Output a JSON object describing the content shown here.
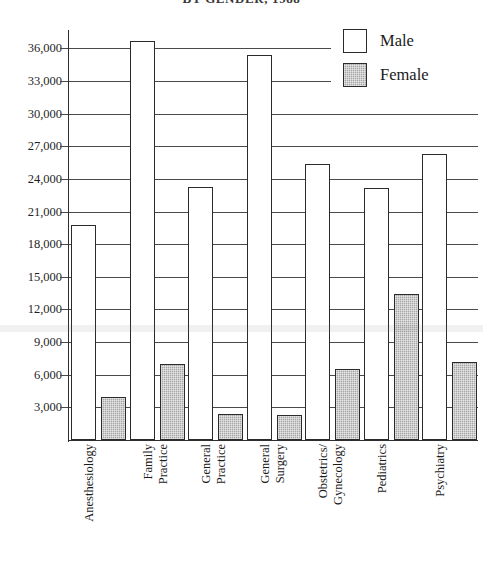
{
  "chart_data": {
    "type": "bar",
    "title": "BY GENDER, 1988",
    "xlabel": "",
    "ylabel": "",
    "ylim": [
      0,
      37500
    ],
    "grid": true,
    "legend_position": "top-right",
    "categories": [
      "Anesthesiology",
      "Family Practice",
      "General Practice",
      "General Surgery",
      "Obstetrics/Gynecology",
      "Pediatrics",
      "Psychiatry"
    ],
    "category_lines": [
      [
        "Anesthesiology",
        ""
      ],
      [
        "Family",
        "Practice"
      ],
      [
        "General",
        "Practice"
      ],
      [
        "General",
        "Surgery"
      ],
      [
        "Obstetrics/",
        "Gynecology"
      ],
      [
        "Pediatrics",
        ""
      ],
      [
        "Psychiatry",
        ""
      ]
    ],
    "series": [
      {
        "name": "Male",
        "color": "#ffffff",
        "values": [
          19800,
          36700,
          23300,
          35400,
          25400,
          23200,
          26300
        ]
      },
      {
        "name": "Female",
        "color": "#a6a6a6",
        "values": [
          3950,
          7000,
          2350,
          2300,
          6550,
          13400,
          7200
        ]
      }
    ],
    "yticks": [
      3000,
      6000,
      9000,
      12000,
      15000,
      18000,
      21000,
      24000,
      27000,
      30000,
      33000,
      36000
    ],
    "ytick_labels": [
      "3,000",
      "6,000",
      "9,000",
      "12,000",
      "15,000",
      "18,000",
      "21,000",
      "24,000",
      "27,000",
      "30,000",
      "33,000",
      "36,000"
    ]
  },
  "legend": {
    "items": [
      {
        "label": "Male",
        "swatch": "white-square"
      },
      {
        "label": "Female",
        "swatch": "gray-hatched-square"
      }
    ]
  }
}
